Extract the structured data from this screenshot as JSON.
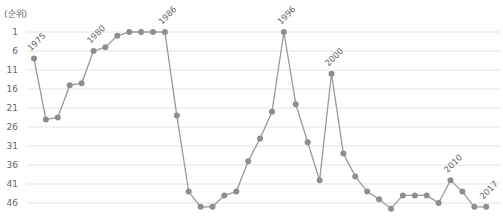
{
  "chart_data": {
    "type": "line",
    "title": "",
    "ylabel": "(순위)",
    "xlabel": "",
    "y_inverted": true,
    "ylim": [
      1,
      46
    ],
    "y_ticks": [
      1,
      6,
      11,
      16,
      21,
      26,
      31,
      36,
      41,
      46
    ],
    "grid": true,
    "legend": null,
    "x": [
      "1975",
      "1976",
      "1977",
      "1978",
      "1979",
      "1980",
      "1981",
      "1982",
      "1983",
      "1984",
      "1985",
      "1986",
      "1987",
      "1988",
      "1989",
      "1990",
      "1991",
      "1992",
      "1993",
      "1994",
      "1995",
      "1996",
      "1997",
      "1998",
      "1999",
      "2000",
      "2001",
      "2002",
      "2003",
      "2004",
      "2005",
      "2006",
      "2007",
      "2008",
      "2009",
      "2010",
      "2011",
      "2012",
      "2017"
    ],
    "values": [
      8,
      24,
      23.5,
      15,
      14.5,
      6,
      5,
      2,
      1,
      1,
      1,
      1,
      23,
      43,
      47,
      47,
      44,
      43,
      35,
      29,
      22,
      1,
      20,
      30,
      40,
      12,
      33,
      39,
      43,
      45,
      47.5,
      44,
      44,
      44,
      46,
      40,
      43,
      47,
      47
    ],
    "point_labels": [
      {
        "index": 0,
        "text": "1975"
      },
      {
        "index": 5,
        "text": "1980"
      },
      {
        "index": 11,
        "text": "1986"
      },
      {
        "index": 21,
        "text": "1996"
      },
      {
        "index": 25,
        "text": "2000"
      },
      {
        "index": 35,
        "text": "2010"
      },
      {
        "index": 38,
        "text": "2017"
      }
    ],
    "colors": {
      "line": "#9a9a9a",
      "marker": "#8e8e8e",
      "grid": "#e3e3e3",
      "text": "#666666"
    }
  }
}
